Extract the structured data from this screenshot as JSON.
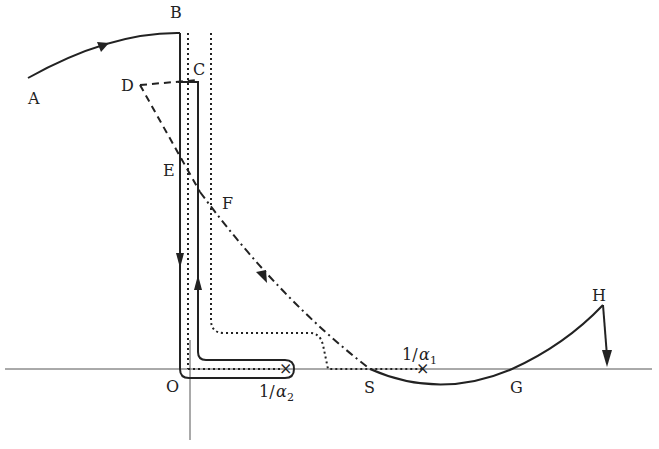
{
  "diagram": {
    "type": "contour-plot",
    "points": {
      "A": "A",
      "B": "B",
      "C": "C",
      "D": "D",
      "E": "E",
      "F": "F",
      "S": "S",
      "G": "G",
      "H": "H",
      "O": "O"
    },
    "poles": {
      "alpha2": {
        "prefix": "1/",
        "symbol": "α",
        "subscript": "2"
      },
      "alpha1": {
        "prefix": "1/",
        "symbol": "α",
        "subscript": "1"
      }
    },
    "pole_marker": "×",
    "colors": {
      "stroke": "#222222",
      "axis": "#555555",
      "background": "#ffffff"
    }
  }
}
